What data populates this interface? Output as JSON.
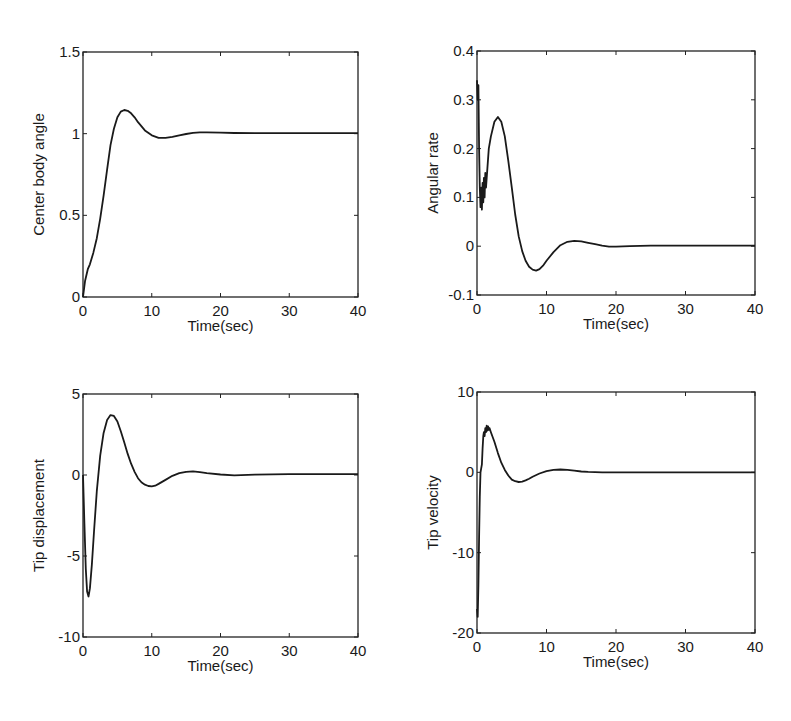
{
  "chart_data": [
    {
      "type": "line",
      "title": "",
      "xlabel": "Time(sec)",
      "ylabel": "Center body angle",
      "xlim": [
        0,
        40
      ],
      "ylim": [
        0,
        1.5
      ],
      "xticks": [
        0,
        10,
        20,
        30,
        40
      ],
      "xtick_labels": [
        "0",
        "10",
        "20",
        "30",
        "40"
      ],
      "yticks": [
        0,
        0.5,
        1,
        1.5
      ],
      "ytick_labels": [
        "0",
        "0.5",
        "1",
        "1.5"
      ],
      "grid": false,
      "legend": null,
      "box": {
        "left": 83,
        "top": 52,
        "right": 358,
        "bottom": 297
      },
      "series": [
        {
          "name": "Center body angle",
          "x": [
            0,
            0.3,
            0.7,
            1,
            1.5,
            2,
            2.5,
            3,
            3.5,
            4,
            4.5,
            5,
            5.5,
            6,
            6.5,
            7,
            7.5,
            8,
            9,
            10,
            11,
            12,
            13,
            14,
            15,
            16,
            17,
            18,
            20,
            22,
            25,
            30,
            35,
            40
          ],
          "y": [
            0,
            0.1,
            0.17,
            0.2,
            0.27,
            0.36,
            0.48,
            0.62,
            0.78,
            0.93,
            1.03,
            1.1,
            1.135,
            1.145,
            1.14,
            1.125,
            1.1,
            1.07,
            1.02,
            0.99,
            0.975,
            0.975,
            0.98,
            0.99,
            0.998,
            1.005,
            1.008,
            1.008,
            1.006,
            1.004,
            1.003,
            1.003,
            1.003,
            1.003
          ]
        }
      ]
    },
    {
      "type": "line",
      "title": "",
      "xlabel": "Time(sec)",
      "ylabel": "Angular rate",
      "xlim": [
        0,
        40
      ],
      "ylim": [
        -0.1,
        0.4
      ],
      "xticks": [
        0,
        10,
        20,
        30,
        40
      ],
      "xtick_labels": [
        "0",
        "10",
        "20",
        "30",
        "40"
      ],
      "yticks": [
        -0.1,
        0,
        0.1,
        0.2,
        0.3,
        0.4
      ],
      "ytick_labels": [
        "-0.1",
        "0",
        "0.1",
        "0.2",
        "0.3",
        "0.4"
      ],
      "grid": false,
      "legend": null,
      "box": {
        "left": 477,
        "top": 51,
        "right": 755,
        "bottom": 295
      },
      "series": [
        {
          "name": "Angular rate",
          "x": [
            0,
            0.1,
            0.2,
            0.3,
            0.4,
            0.5,
            0.6,
            0.7,
            0.8,
            0.9,
            1.0,
            1.1,
            1.2,
            1.3,
            1.5,
            1.7,
            2,
            2.5,
            3,
            3.5,
            4,
            4.5,
            5,
            5.5,
            6,
            6.5,
            7,
            7.5,
            8,
            8.5,
            9,
            9.5,
            10,
            11,
            12,
            13,
            14,
            15,
            16,
            17,
            18,
            19,
            20,
            22,
            25,
            30,
            35,
            40
          ],
          "y": [
            0.34,
            0.3,
            0.33,
            0.2,
            0.12,
            0.08,
            0.12,
            0.075,
            0.13,
            0.09,
            0.14,
            0.1,
            0.15,
            0.12,
            0.16,
            0.2,
            0.225,
            0.255,
            0.265,
            0.255,
            0.225,
            0.175,
            0.12,
            0.065,
            0.02,
            -0.01,
            -0.03,
            -0.042,
            -0.048,
            -0.05,
            -0.047,
            -0.04,
            -0.03,
            -0.012,
            0.002,
            0.009,
            0.011,
            0.01,
            0.007,
            0.004,
            0.001,
            -0.001,
            -0.001,
            0.0,
            0.001,
            0.001,
            0.001,
            0.001
          ]
        }
      ]
    },
    {
      "type": "line",
      "title": "",
      "xlabel": "Time(sec)",
      "ylabel": "Tip displacement",
      "xlim": [
        0,
        40
      ],
      "ylim": [
        -10,
        5
      ],
      "xticks": [
        0,
        10,
        20,
        30,
        40
      ],
      "xtick_labels": [
        "0",
        "10",
        "20",
        "30",
        "40"
      ],
      "yticks": [
        -10,
        -5,
        0,
        5
      ],
      "ytick_labels": [
        "-10",
        "-5",
        "0",
        "5"
      ],
      "grid": false,
      "legend": null,
      "box": {
        "left": 83,
        "top": 394,
        "right": 358,
        "bottom": 637
      },
      "series": [
        {
          "name": "Tip displacement",
          "x": [
            0,
            0.2,
            0.4,
            0.6,
            0.8,
            1.0,
            1.3,
            1.6,
            2,
            2.5,
            3,
            3.5,
            4,
            4.5,
            5,
            5.5,
            6,
            6.5,
            7,
            7.5,
            8,
            8.5,
            9,
            9.5,
            10,
            10.5,
            11,
            12,
            13,
            14,
            15,
            16,
            17,
            18,
            20,
            22,
            25,
            30,
            35,
            40
          ],
          "y": [
            0,
            -3,
            -5.8,
            -7.2,
            -7.5,
            -7.0,
            -5.5,
            -3.5,
            -1.0,
            1.2,
            2.6,
            3.4,
            3.7,
            3.65,
            3.3,
            2.7,
            2.0,
            1.3,
            0.7,
            0.2,
            -0.2,
            -0.45,
            -0.6,
            -0.68,
            -0.7,
            -0.66,
            -0.55,
            -0.3,
            -0.05,
            0.12,
            0.2,
            0.22,
            0.18,
            0.12,
            0.03,
            -0.02,
            0.02,
            0.05,
            0.05,
            0.05
          ]
        }
      ]
    },
    {
      "type": "line",
      "title": "",
      "xlabel": "Time(sec)",
      "ylabel": "Tip velocity",
      "xlim": [
        0,
        40
      ],
      "ylim": [
        -20,
        10
      ],
      "xticks": [
        0,
        10,
        20,
        30,
        40
      ],
      "xtick_labels": [
        "0",
        "10",
        "20",
        "30",
        "40"
      ],
      "yticks": [
        -20,
        -10,
        0,
        10
      ],
      "ytick_labels": [
        "-20",
        "-10",
        "0",
        "10"
      ],
      "grid": false,
      "legend": null,
      "box": {
        "left": 477,
        "top": 392,
        "right": 755,
        "bottom": 633
      },
      "series": [
        {
          "name": "Tip velocity",
          "x": [
            0,
            0.1,
            0.2,
            0.3,
            0.4,
            0.5,
            0.6,
            0.7,
            0.8,
            0.9,
            1.0,
            1.1,
            1.2,
            1.3,
            1.4,
            1.5,
            1.6,
            1.7,
            1.8,
            2.0,
            2.5,
            3,
            3.5,
            4,
            4.5,
            5,
            5.5,
            6,
            6.5,
            7,
            7.5,
            8,
            9,
            10,
            11,
            12,
            13,
            14,
            15,
            16,
            18,
            20,
            25,
            30,
            35,
            40
          ],
          "y": [
            -17,
            -18,
            -14,
            -8,
            -3,
            0,
            0.5,
            1,
            3,
            4.5,
            5,
            4.5,
            5.5,
            5,
            5.8,
            5.2,
            5.7,
            5.3,
            5.5,
            5.0,
            3.8,
            2.4,
            1.2,
            0.3,
            -0.4,
            -0.9,
            -1.1,
            -1.2,
            -1.15,
            -1.0,
            -0.8,
            -0.55,
            -0.15,
            0.15,
            0.3,
            0.35,
            0.3,
            0.2,
            0.1,
            0.05,
            0.0,
            0.0,
            0.0,
            0.0,
            0.0,
            0.0
          ]
        }
      ]
    }
  ]
}
